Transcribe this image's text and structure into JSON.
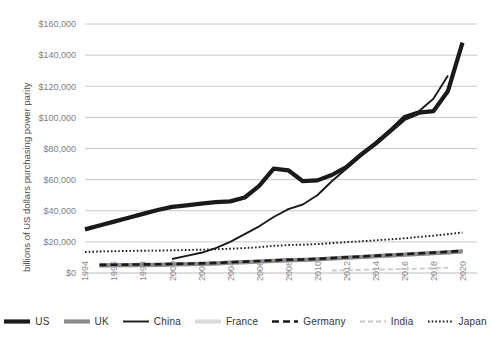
{
  "chart": {
    "type": "line",
    "title": "",
    "xlabel": "",
    "ylabel": "billions of US dollars purchasing power parity"
  },
  "axes": {
    "y_ticks": [
      "$0",
      "$20,000",
      "$40,000",
      "$60,000",
      "$80,000",
      "$100,000",
      "$120,000",
      "$140,000",
      "$160,000"
    ],
    "x_ticks": [
      "1994",
      "1996",
      "1998",
      "2000",
      "2002",
      "2004",
      "2006",
      "2008",
      "2010",
      "2012",
      "2014",
      "2016",
      "2018",
      "2020"
    ]
  },
  "legend": {
    "position": "bottom",
    "items": [
      {
        "label": "US",
        "style": "thick-solid",
        "color": "#1a1a1a"
      },
      {
        "label": "UK",
        "style": "thick-solid",
        "color": "#8c8c8c"
      },
      {
        "label": "China",
        "style": "thin-solid",
        "color": "#1a1a1a"
      },
      {
        "label": "France",
        "style": "thick-solid",
        "color": "#dcdcdc"
      },
      {
        "label": "Germany",
        "style": "dashed",
        "color": "#1a1a1a"
      },
      {
        "label": "India",
        "style": "dashed-light",
        "color": "#c9c9c9"
      },
      {
        "label": "Japan",
        "style": "dotted",
        "color": "#1a1a1a"
      }
    ]
  },
  "chart_data": {
    "type": "line",
    "title": "",
    "xlabel": "",
    "ylabel": "billions of US dollars purchasing power parity",
    "ylim": [
      0,
      160000
    ],
    "xlim": [
      1994,
      2021
    ],
    "grid": "horizontal",
    "legend_position": "bottom",
    "y_tick_values": [
      0,
      20000,
      40000,
      60000,
      80000,
      100000,
      120000,
      140000,
      160000
    ],
    "x_tick_values": [
      1994,
      1996,
      1998,
      2000,
      2002,
      2004,
      2006,
      2008,
      2010,
      2012,
      2014,
      2016,
      2018,
      2020
    ],
    "x": [
      1994,
      1995,
      1996,
      1997,
      1998,
      1999,
      2000,
      2001,
      2002,
      2003,
      2004,
      2005,
      2006,
      2007,
      2008,
      2009,
      2010,
      2011,
      2012,
      2013,
      2014,
      2015,
      2016,
      2017,
      2018,
      2019,
      2020
    ],
    "series": [
      {
        "name": "US",
        "color": "#1a1a1a",
        "style": "thick-solid",
        "values": [
          28000,
          30500,
          33000,
          35500,
          38000,
          40500,
          42500,
          43500,
          44500,
          45500,
          46000,
          48500,
          56000,
          67000,
          66000,
          59000,
          59500,
          63000,
          68000,
          76000,
          83000,
          91000,
          99000,
          103000,
          104000,
          117000,
          148000
        ]
      },
      {
        "name": "China",
        "color": "#1a1a1a",
        "style": "thin-solid",
        "values": [
          null,
          null,
          null,
          null,
          null,
          null,
          9000,
          11000,
          13000,
          16000,
          20000,
          25000,
          30000,
          36000,
          41000,
          44000,
          50000,
          59000,
          67000,
          75000,
          84000,
          92000,
          101000,
          104000,
          112000,
          127000,
          null
        ]
      },
      {
        "name": "Japan",
        "color": "#1a1a1a",
        "style": "dotted",
        "values": [
          13500,
          13800,
          14000,
          14200,
          14300,
          14400,
          14600,
          14800,
          15000,
          15200,
          15600,
          16000,
          16600,
          17400,
          18000,
          18200,
          18600,
          19200,
          19800,
          20400,
          21000,
          21600,
          22300,
          23200,
          24000,
          25000,
          26000
        ]
      },
      {
        "name": "Germany",
        "color": "#1a1a1a",
        "style": "dashed",
        "values": [
          null,
          5200,
          5300,
          5400,
          5500,
          5600,
          5800,
          6000,
          6200,
          6500,
          6900,
          7300,
          7700,
          8100,
          8500,
          8700,
          9100,
          9600,
          10100,
          10600,
          11100,
          11600,
          12100,
          12600,
          13100,
          13600,
          14200
        ]
      },
      {
        "name": "UK",
        "color": "#8c8c8c",
        "style": "thick-solid",
        "values": [
          null,
          4900,
          5000,
          5100,
          5200,
          5300,
          5500,
          5700,
          5900,
          6200,
          6600,
          7000,
          7400,
          7800,
          8200,
          8400,
          8800,
          9300,
          9800,
          10300,
          10800,
          11300,
          11800,
          12300,
          12800,
          13300,
          13900
        ]
      },
      {
        "name": "France",
        "color": "#dcdcdc",
        "style": "thick-solid",
        "values": [
          null,
          4800,
          4900,
          5000,
          5100,
          5200,
          5400,
          5600,
          5800,
          6100,
          6500,
          6900,
          7300,
          7700,
          8100,
          8300,
          8700,
          9200,
          9700,
          10200,
          10700,
          11200,
          11700,
          12200,
          12700,
          13200,
          13800
        ]
      },
      {
        "name": "India",
        "color": "#c9c9c9",
        "style": "dashed-light",
        "values": [
          null,
          null,
          null,
          null,
          null,
          null,
          null,
          null,
          null,
          null,
          null,
          null,
          null,
          null,
          null,
          null,
          null,
          1600,
          1800,
          2000,
          2200,
          2400,
          2600,
          2800,
          3100,
          3400,
          null
        ]
      }
    ]
  }
}
